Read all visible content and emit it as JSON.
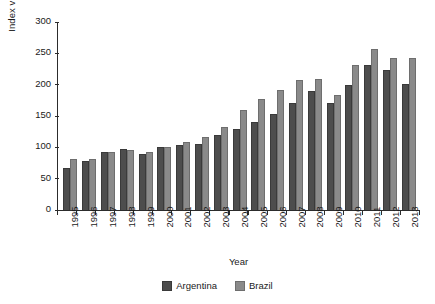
{
  "chart_data": {
    "type": "bar",
    "title": "",
    "xlabel": "Year",
    "ylabel": "Index value",
    "ylim": [
      0,
      300
    ],
    "yticks": [
      0,
      50,
      100,
      150,
      200,
      250,
      300
    ],
    "grid": false,
    "legend_position": "bottom",
    "categories": [
      "1995",
      "1996",
      "1997",
      "1998",
      "1999",
      "2000",
      "2001",
      "2002",
      "2003",
      "2004",
      "2005",
      "2006",
      "2007",
      "2008",
      "2009",
      "2010",
      "2011",
      "2012",
      "2013"
    ],
    "series": [
      {
        "name": "Argentina",
        "color": "#4d4d4d",
        "values": [
          67,
          79,
          93,
          97,
          89,
          100,
          104,
          106,
          119,
          129,
          140,
          153,
          171,
          190,
          171,
          200,
          231,
          224,
          201
        ]
      },
      {
        "name": "Brazil",
        "color": "#8a8a8a",
        "values": [
          81,
          81,
          93,
          95,
          92,
          100,
          109,
          117,
          133,
          160,
          177,
          192,
          207,
          209,
          183,
          232,
          257,
          242,
          243
        ]
      }
    ]
  }
}
